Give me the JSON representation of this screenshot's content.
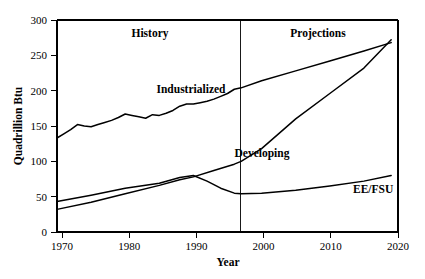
{
  "chart_data": {
    "type": "line",
    "title": "",
    "xlabel": "Year",
    "ylabel": "Quadrillion Btu",
    "xlim": [
      1970,
      2020
    ],
    "ylim": [
      0,
      300
    ],
    "grid": false,
    "legend_position": "inline-annotations",
    "x_ticks": [
      1970,
      1980,
      1990,
      2000,
      2010,
      2020
    ],
    "x_tick_labels": [
      "1970",
      "1980",
      "1990",
      "2000",
      "2010",
      "2020"
    ],
    "y_ticks": [
      0,
      50,
      100,
      150,
      200,
      250,
      300
    ],
    "y_tick_labels": [
      "0",
      "50",
      "100",
      "150",
      "200",
      "250",
      "300"
    ],
    "annotations": [
      {
        "text": "History",
        "x": 1983,
        "y": 288
      },
      {
        "text": "Projections",
        "x": 2008,
        "y": 288
      },
      {
        "text": "Industrialized",
        "x": 1989,
        "y": 208
      },
      {
        "text": "Developing",
        "x": 2000,
        "y": 133
      },
      {
        "text": "EE/FSU",
        "x": 2014,
        "y": 62
      }
    ],
    "divider": {
      "x": 1996.5,
      "label_left": "History",
      "label_right": "Projections"
    },
    "series": [
      {
        "name": "Industrialized",
        "x": [
          1970,
          1971,
          1972,
          1973,
          1974,
          1975,
          1976,
          1977,
          1978,
          1979,
          1980,
          1981,
          1982,
          1983,
          1984,
          1985,
          1986,
          1987,
          1988,
          1989,
          1990,
          1991,
          1992,
          1993,
          1994,
          1995,
          1996,
          1997,
          2000,
          2005,
          2010,
          2015,
          2019
        ],
        "values": [
          133,
          139,
          145,
          152,
          150,
          149,
          152,
          155,
          158,
          162,
          167,
          165,
          163,
          161,
          166,
          165,
          168,
          172,
          178,
          181,
          181,
          183,
          185,
          188,
          192,
          196,
          202,
          204,
          214,
          228,
          242,
          256,
          268
        ]
      },
      {
        "name": "Developing",
        "x": [
          1970,
          1975,
          1980,
          1985,
          1988,
          1990,
          1993,
          1996,
          1997,
          2000,
          2005,
          2010,
          2015,
          2019
        ],
        "values": [
          32,
          42,
          54,
          66,
          74,
          78,
          87,
          96,
          100,
          118,
          160,
          196,
          232,
          272
        ]
      },
      {
        "name": "EE/FSU",
        "x": [
          1970,
          1975,
          1980,
          1983,
          1985,
          1988,
          1990,
          1992,
          1994,
          1996,
          1997,
          2000,
          2005,
          2010,
          2015,
          2019
        ],
        "values": [
          43,
          52,
          62,
          66,
          69,
          77,
          80,
          72,
          62,
          55,
          54,
          55,
          59,
          65,
          72,
          80
        ]
      }
    ]
  },
  "axis": {
    "y_title": "Quadrillion Btu",
    "x_title": "Year"
  }
}
